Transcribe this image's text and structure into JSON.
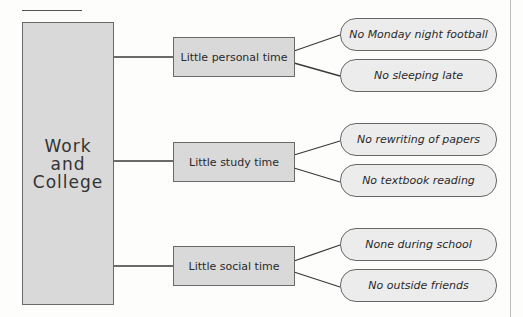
{
  "diagram": {
    "root": {
      "label": "Work\nand\nCollege"
    },
    "branches": [
      {
        "label": "Little personal time",
        "leaves": [
          "No Monday night football",
          "No sleeping late"
        ]
      },
      {
        "label": "Little study time",
        "leaves": [
          "No rewriting of papers",
          "No textbook reading"
        ]
      },
      {
        "label": "Little social time",
        "leaves": [
          "None during school",
          "No outside friends"
        ]
      }
    ]
  },
  "colors": {
    "box_fill": "#d9d9d9",
    "pill_fill": "#ececec",
    "line": "#3a3a3a"
  }
}
